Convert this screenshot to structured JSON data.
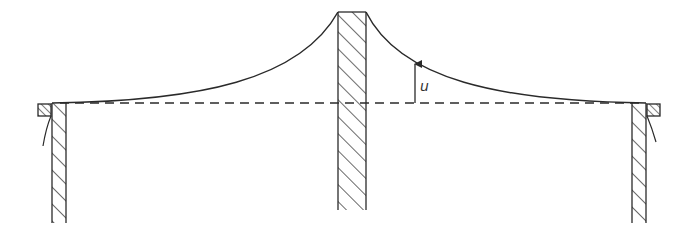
{
  "diagram": {
    "displacement_label": "u",
    "colors": {
      "stroke": "#2a2a2a",
      "hatch": "#2a2a2a",
      "background": "#ffffff"
    },
    "elements": [
      {
        "name": "left-support-wall",
        "type": "hatched-wall"
      },
      {
        "name": "center-pillar",
        "type": "hatched-wall"
      },
      {
        "name": "right-support-wall",
        "type": "hatched-wall"
      },
      {
        "name": "left-clamp-block",
        "type": "hatched-block"
      },
      {
        "name": "right-clamp-block",
        "type": "hatched-block"
      },
      {
        "name": "deflected-membrane-curve",
        "type": "curve"
      },
      {
        "name": "reference-dashed-line",
        "type": "dashed-line"
      },
      {
        "name": "displacement-arrow",
        "type": "arrow",
        "label": "u"
      }
    ]
  }
}
